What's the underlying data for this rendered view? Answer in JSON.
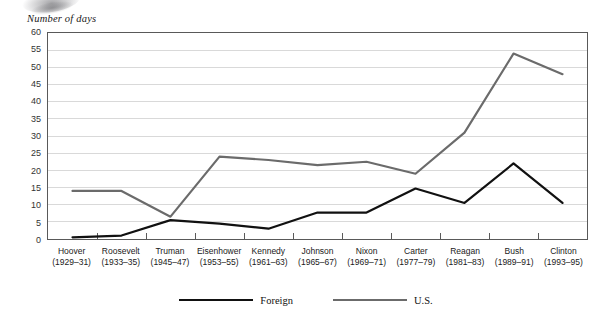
{
  "axis_title": "Number of days",
  "legend": {
    "items": [
      {
        "label": "Foreign",
        "color": "#111111",
        "width": 2.2
      },
      {
        "label": "U.S.",
        "color": "#6b6b6b",
        "width": 2.2
      }
    ]
  },
  "chart_data": {
    "type": "line",
    "title": "",
    "xlabel": "",
    "ylabel": "Number of days",
    "ylim": [
      0,
      60
    ],
    "ytick_step": 5,
    "yticks": [
      0,
      5,
      10,
      15,
      20,
      25,
      30,
      35,
      40,
      45,
      50,
      55,
      60
    ],
    "grid": true,
    "legend_position": "bottom",
    "categories": [
      "Hoover",
      "Roosevelt",
      "Truman",
      "Eisenhower",
      "Kennedy",
      "Johnson",
      "Nixon",
      "Carter",
      "Reagan",
      "Bush",
      "Clinton"
    ],
    "category_years": [
      "(1929–31)",
      "(1933–35)",
      "(1945–47)",
      "(1953–55)",
      "(1961–63)",
      "(1965–67)",
      "(1969–71)",
      "(1977–79)",
      "(1981–83)",
      "(1989–91)",
      "(1993–95)"
    ],
    "series": [
      {
        "name": "Foreign",
        "color": "#111111",
        "values": [
          0.5,
          1,
          5.5,
          4.5,
          3,
          7.7,
          7.7,
          14.7,
          10.5,
          22,
          10.5
        ]
      },
      {
        "name": "U.S.",
        "color": "#6b6b6b",
        "values": [
          14,
          14,
          6.5,
          24,
          23,
          21.5,
          22.5,
          19,
          31,
          54,
          48
        ]
      }
    ]
  }
}
